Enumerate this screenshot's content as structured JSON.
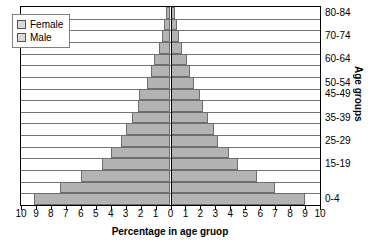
{
  "chart_data": {
    "type": "bar",
    "subtype": "population-pyramid",
    "title": "",
    "xlabel": "Percentage in age gruop",
    "ylabel": "Age groups",
    "categories": [
      "0-4",
      "5-9",
      "10-14",
      "15-19",
      "20-24",
      "25-29",
      "30-34",
      "35-39",
      "40-44",
      "45-49",
      "50-54",
      "55-59",
      "60-64",
      "65-69",
      "70-74",
      "75-79",
      "80-84"
    ],
    "series": [
      {
        "name": "Female",
        "side": "left",
        "values": [
          9.1,
          7.4,
          6.0,
          4.6,
          4.0,
          3.3,
          3.0,
          2.6,
          2.2,
          2.1,
          1.6,
          1.3,
          1.1,
          0.8,
          0.6,
          0.45,
          0.3
        ]
      },
      {
        "name": "Male",
        "side": "right",
        "values": [
          9.0,
          7.0,
          5.8,
          4.5,
          3.9,
          3.2,
          2.9,
          2.5,
          2.2,
          2.0,
          1.6,
          1.3,
          1.1,
          0.8,
          0.6,
          0.45,
          0.3
        ]
      }
    ],
    "xlim": [
      -10,
      10
    ],
    "xticks": [
      "10",
      "9",
      "8",
      "7",
      "6",
      "5",
      "4",
      "3",
      "2",
      "1",
      "0",
      "1",
      "2",
      "3",
      "4",
      "5",
      "6",
      "7",
      "8",
      "9",
      "10"
    ],
    "ytick_labels": [
      "0-4",
      "15-19",
      "25-29",
      "35-39",
      "45-49",
      "50-54",
      "60-64",
      "70-74",
      "80-84"
    ],
    "ytick_categories": [
      "0-4",
      "15-19",
      "25-29",
      "35-39",
      "45-49",
      "50-54",
      "60-64",
      "70-74",
      "80-84"
    ],
    "grid": true,
    "legend_position": "top-left",
    "bar_color": "#b3b3b3",
    "bar_border_color": "#6e6e6e"
  },
  "legend": {
    "items": [
      {
        "label": "Female"
      },
      {
        "label": "Male"
      }
    ]
  }
}
